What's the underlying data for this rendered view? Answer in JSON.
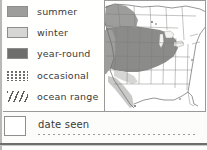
{
  "legend": {
    "items": [
      {
        "key": "summer",
        "label": "summer",
        "swatch": "solid-medium-gray",
        "color": "#9d9d9b"
      },
      {
        "key": "winter",
        "label": "winter",
        "swatch": "solid-light-gray",
        "color": "#d6d6d4"
      },
      {
        "key": "year-round",
        "label": "year-round",
        "swatch": "solid-dark-gray",
        "color": "#6e6e6c"
      },
      {
        "key": "occasional",
        "label": "occasional",
        "swatch": "dotted-pattern",
        "color": "#6e6e6c"
      },
      {
        "key": "ocean-range",
        "label": "ocean range",
        "swatch": "diagonal-hatch",
        "color": "#5f5f5d"
      }
    ]
  },
  "map": {
    "name": "north-america-range-map",
    "region": "North America",
    "shaded_regions": {
      "summer": "northwest-canada-and-pacific-northwest",
      "winter": "baja-california-and-southwest-coast",
      "year-round": "great-plains-upper-midwest-great-lakes"
    }
  },
  "footer": {
    "checkbox_label": "date seen",
    "checkbox_checked": false,
    "write_in_line": ""
  },
  "colors": {
    "summer": "#9d9d9b",
    "winter": "#d6d6d4",
    "year_round": "#6e6e6c",
    "ink": "#3a3a38",
    "rule": "#9a9a98",
    "paper": "#fffffe"
  }
}
